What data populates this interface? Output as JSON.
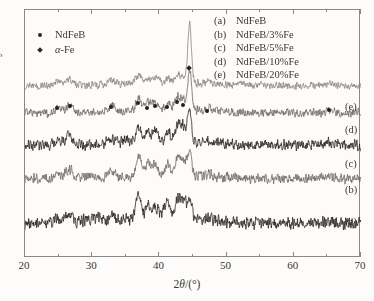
{
  "figure": {
    "background": "#fdfcfa",
    "frame_color": "#8d8781"
  },
  "axes": {
    "x_label_prefix": "2",
    "x_label_theta": "θ",
    "x_label_suffix": "/(°)",
    "x_label_full": "2θ/(°)",
    "y_label": "Intensity/a.u."
  },
  "marker_legend": {
    "items": [
      {
        "glyph": "circle-marker-icon",
        "label": "NdFeB",
        "italic_head": ""
      },
      {
        "glyph": "diamond-marker-icon",
        "label": "-Fe",
        "italic_head": "α"
      }
    ]
  },
  "curve_legend": {
    "items": [
      {
        "tag": "(a)",
        "name": "NdFeB"
      },
      {
        "tag": "(b)",
        "name": "NdFeB/3%Fe"
      },
      {
        "tag": "(c)",
        "name": "NdFeB/5%Fe"
      },
      {
        "tag": "(d)",
        "name": "NdFeB/10%Fe"
      },
      {
        "tag": "(e)",
        "name": "NdFeB/20%Fe"
      }
    ]
  },
  "curve_tags": [
    {
      "tag": "(e)",
      "x": 345,
      "y": 101
    },
    {
      "tag": "(d)",
      "x": 345,
      "y": 124
    },
    {
      "tag": "(c)",
      "x": 345,
      "y": 158
    },
    {
      "tag": "(b)",
      "x": 345,
      "y": 184
    },
    {
      "tag": "(a)",
      "x": 345,
      "y": 216
    }
  ],
  "chart_data": {
    "type": "line",
    "title": "",
    "xlabel": "2θ/(°)",
    "ylabel": "Intensity/a.u.",
    "xlim": [
      20,
      70
    ],
    "ylim": [
      0,
      1
    ],
    "grid": false,
    "legend_position": "top-right",
    "x_ticks_major": [
      20,
      30,
      40,
      50,
      60,
      70
    ],
    "x_ticks_minor": [
      25,
      35,
      45,
      55,
      65
    ],
    "y_ticks": [],
    "series": [
      {
        "name": "(a) NdFeB",
        "tag": "(a)",
        "color": "#2a2724",
        "baseline": 0.14,
        "amplitude": 1.0,
        "noise": 0.03,
        "seed": 11,
        "peaks": [
          {
            "pos": 24.8,
            "h": 0.018,
            "w": 0.55
          },
          {
            "pos": 26.6,
            "h": 0.04,
            "w": 0.5
          },
          {
            "pos": 29.2,
            "h": 0.015,
            "w": 0.55
          },
          {
            "pos": 30.9,
            "h": 0.018,
            "w": 0.5
          },
          {
            "pos": 32.9,
            "h": 0.03,
            "w": 0.5
          },
          {
            "pos": 35.0,
            "h": 0.016,
            "w": 0.55
          },
          {
            "pos": 36.9,
            "h": 0.105,
            "w": 0.4
          },
          {
            "pos": 38.3,
            "h": 0.062,
            "w": 0.4
          },
          {
            "pos": 39.4,
            "h": 0.058,
            "w": 0.4
          },
          {
            "pos": 40.6,
            "h": 0.04,
            "w": 0.4
          },
          {
            "pos": 41.3,
            "h": 0.055,
            "w": 0.38
          },
          {
            "pos": 42.7,
            "h": 0.09,
            "w": 0.38
          },
          {
            "pos": 43.6,
            "h": 0.07,
            "w": 0.38
          },
          {
            "pos": 44.5,
            "h": 0.085,
            "w": 0.35
          },
          {
            "pos": 47.3,
            "h": 0.014,
            "w": 0.5
          },
          {
            "pos": 65.3,
            "h": 0.012,
            "w": 0.6
          }
        ]
      },
      {
        "name": "(b) NdFeB/3%Fe",
        "tag": "(b)",
        "color": "#6d6a66",
        "baseline": 0.32,
        "amplitude": 1.0,
        "noise": 0.024,
        "seed": 23,
        "peaks": [
          {
            "pos": 24.9,
            "h": 0.015,
            "w": 0.55
          },
          {
            "pos": 26.6,
            "h": 0.036,
            "w": 0.5
          },
          {
            "pos": 29.3,
            "h": 0.013,
            "w": 0.55
          },
          {
            "pos": 32.9,
            "h": 0.026,
            "w": 0.5
          },
          {
            "pos": 36.9,
            "h": 0.085,
            "w": 0.4
          },
          {
            "pos": 38.3,
            "h": 0.05,
            "w": 0.4
          },
          {
            "pos": 39.4,
            "h": 0.046,
            "w": 0.4
          },
          {
            "pos": 41.3,
            "h": 0.045,
            "w": 0.38
          },
          {
            "pos": 42.7,
            "h": 0.072,
            "w": 0.38
          },
          {
            "pos": 43.6,
            "h": 0.058,
            "w": 0.38
          },
          {
            "pos": 44.5,
            "h": 0.09,
            "w": 0.33
          },
          {
            "pos": 47.3,
            "h": 0.012,
            "w": 0.5
          },
          {
            "pos": 65.3,
            "h": 0.01,
            "w": 0.6
          }
        ]
      },
      {
        "name": "(c) NdFeB/5%Fe",
        "tag": "(c)",
        "color": "#2a2724",
        "baseline": 0.455,
        "amplitude": 1.0,
        "noise": 0.026,
        "seed": 37,
        "peaks": [
          {
            "pos": 24.9,
            "h": 0.016,
            "w": 0.55
          },
          {
            "pos": 26.6,
            "h": 0.04,
            "w": 0.5
          },
          {
            "pos": 32.9,
            "h": 0.024,
            "w": 0.5
          },
          {
            "pos": 35.0,
            "h": 0.014,
            "w": 0.55
          },
          {
            "pos": 36.9,
            "h": 0.072,
            "w": 0.4
          },
          {
            "pos": 38.3,
            "h": 0.048,
            "w": 0.4
          },
          {
            "pos": 39.4,
            "h": 0.046,
            "w": 0.4
          },
          {
            "pos": 41.3,
            "h": 0.045,
            "w": 0.38
          },
          {
            "pos": 42.7,
            "h": 0.076,
            "w": 0.38
          },
          {
            "pos": 43.6,
            "h": 0.062,
            "w": 0.38
          },
          {
            "pos": 44.5,
            "h": 0.118,
            "w": 0.3
          },
          {
            "pos": 47.3,
            "h": 0.012,
            "w": 0.5
          },
          {
            "pos": 65.3,
            "h": 0.01,
            "w": 0.6
          }
        ]
      },
      {
        "name": "(d) NdFeB/10%Fe",
        "tag": "(d)",
        "color": "#6d6a66",
        "baseline": 0.585,
        "amplitude": 1.0,
        "noise": 0.021,
        "seed": 53,
        "peaks": [
          {
            "pos": 24.9,
            "h": 0.013,
            "w": 0.55
          },
          {
            "pos": 26.6,
            "h": 0.03,
            "w": 0.5
          },
          {
            "pos": 32.9,
            "h": 0.02,
            "w": 0.5
          },
          {
            "pos": 36.9,
            "h": 0.05,
            "w": 0.4
          },
          {
            "pos": 38.3,
            "h": 0.032,
            "w": 0.4
          },
          {
            "pos": 39.4,
            "h": 0.03,
            "w": 0.4
          },
          {
            "pos": 41.3,
            "h": 0.03,
            "w": 0.38
          },
          {
            "pos": 42.7,
            "h": 0.05,
            "w": 0.38
          },
          {
            "pos": 43.6,
            "h": 0.044,
            "w": 0.38
          },
          {
            "pos": 44.5,
            "h": 0.16,
            "w": 0.28
          },
          {
            "pos": 47.3,
            "h": 0.011,
            "w": 0.5
          },
          {
            "pos": 65.3,
            "h": 0.01,
            "w": 0.6
          }
        ]
      },
      {
        "name": "(e) NdFeB/20%Fe",
        "tag": "(e)",
        "color": "#8a8784",
        "baseline": 0.695,
        "amplitude": 1.0,
        "noise": 0.018,
        "seed": 71,
        "peaks": [
          {
            "pos": 24.9,
            "h": 0.013,
            "w": 0.55
          },
          {
            "pos": 26.6,
            "h": 0.024,
            "w": 0.5
          },
          {
            "pos": 32.9,
            "h": 0.018,
            "w": 0.5
          },
          {
            "pos": 36.9,
            "h": 0.034,
            "w": 0.42
          },
          {
            "pos": 38.3,
            "h": 0.022,
            "w": 0.42
          },
          {
            "pos": 39.4,
            "h": 0.022,
            "w": 0.42
          },
          {
            "pos": 41.3,
            "h": 0.02,
            "w": 0.4
          },
          {
            "pos": 42.7,
            "h": 0.03,
            "w": 0.38
          },
          {
            "pos": 43.6,
            "h": 0.03,
            "w": 0.38
          },
          {
            "pos": 44.5,
            "h": 0.25,
            "w": 0.26
          },
          {
            "pos": 47.3,
            "h": 0.01,
            "w": 0.5
          },
          {
            "pos": 65.3,
            "h": 0.009,
            "w": 0.6
          }
        ]
      }
    ],
    "annotations": {
      "ndfeb_peak_markers": [
        {
          "two_theta": 24.9,
          "y": 106
        },
        {
          "two_theta": 26.8,
          "y": 104
        },
        {
          "two_theta": 32.9,
          "y": 105
        },
        {
          "two_theta": 36.9,
          "y": 101
        },
        {
          "two_theta": 38.3,
          "y": 106
        },
        {
          "two_theta": 39.5,
          "y": 104
        },
        {
          "two_theta": 41.3,
          "y": 105
        },
        {
          "two_theta": 42.7,
          "y": 100
        },
        {
          "two_theta": 43.6,
          "y": 103
        },
        {
          "two_theta": 47.3,
          "y": 109
        },
        {
          "two_theta": 65.4,
          "y": 108
        }
      ],
      "alpha_fe_peak_marker": {
        "two_theta": 44.6,
        "y": 66
      }
    }
  }
}
